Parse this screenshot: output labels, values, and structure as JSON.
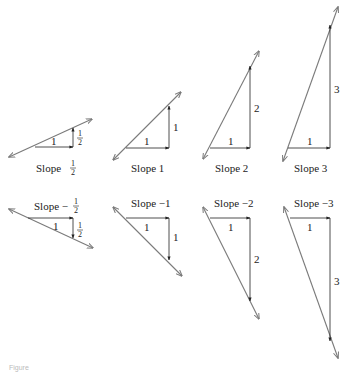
{
  "figure": {
    "caption": "Figure",
    "line_color": "#7a7a7a",
    "arrow_color": "#222222",
    "panels": [
      {
        "id": "slope-half",
        "label_prefix": "Slope",
        "label_value": "1/2",
        "run_label": "1",
        "rise_label": "1/2",
        "slope": 0.5
      },
      {
        "id": "slope-1",
        "label": "Slope 1",
        "run_label": "1",
        "rise_label": "1",
        "slope": 1
      },
      {
        "id": "slope-2",
        "label": "Slope 2",
        "run_label": "1",
        "rise_label": "2",
        "slope": 2
      },
      {
        "id": "slope-3",
        "label": "Slope 3",
        "run_label": "1",
        "rise_label": "3",
        "slope": 3
      },
      {
        "id": "slope-neg-half",
        "label_prefix": "Slope −",
        "label_value": "1/2",
        "run_label": "1",
        "rise_label": "1/2",
        "slope": -0.5
      },
      {
        "id": "slope-neg-1",
        "label": "Slope −1",
        "run_label": "1",
        "rise_label": "1",
        "slope": -1
      },
      {
        "id": "slope-neg-2",
        "label": "Slope −2",
        "run_label": "1",
        "rise_label": "2",
        "slope": -2
      },
      {
        "id": "slope-neg-3",
        "label": "Slope −3",
        "run_label": "1",
        "rise_label": "3",
        "slope": -3
      }
    ],
    "fraction": {
      "num": "1",
      "den": "2"
    }
  }
}
